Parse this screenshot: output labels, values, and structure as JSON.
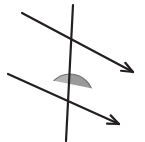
{
  "canvas": {
    "width": 145,
    "height": 142,
    "background": "#ffffff",
    "title": "Parallel lines cut by a transversal with two shaded co-interior angles"
  },
  "palette": {
    "stroke": "#231f20",
    "angle_fill_dark": "#9a9a9a",
    "angle_fill_light": "#b3b3b3",
    "angle_edge": "#6e6e6e",
    "background": "#ffffff"
  },
  "figure": {
    "stroke_width": 2.2,
    "lines": [
      {
        "id": "upper-parallel-ray",
        "label": "upper parallel line",
        "x1": 22,
        "y1": 13,
        "x2": 133,
        "y2": 72,
        "arrow_at": "end"
      },
      {
        "id": "lower-parallel-ray",
        "label": "lower parallel line",
        "x1": 8,
        "y1": 74,
        "x2": 119,
        "y2": 124,
        "arrow_at": "end"
      },
      {
        "id": "transversal-line",
        "label": "transversal",
        "x1": 73,
        "y1": 5,
        "x2": 66,
        "y2": 141,
        "arrow_at": "none"
      }
    ],
    "angles": [
      {
        "id": "upper-angle-mark",
        "label": "shaded angle at upper intersection",
        "cx": 72,
        "cy": 43,
        "radius": 23,
        "flat_edge_angle_deg": 28,
        "bulge": "below",
        "fill_left": "#b3b3b3",
        "fill_right": "#9a9a9a"
      },
      {
        "id": "lower-angle-mark",
        "label": "shaded angle at lower intersection",
        "cx": 70,
        "cy": 97,
        "radius": 23,
        "flat_edge_angle_deg": 24,
        "bulge": "above",
        "fill_left": "#b3b3b3",
        "fill_right": "#9a9a9a"
      }
    ],
    "arrowheads": [
      {
        "id": "upper-arrowhead",
        "x": 133,
        "y": 72,
        "angle_deg": 28
      },
      {
        "id": "lower-arrowhead",
        "x": 119,
        "y": 124,
        "angle_deg": 24
      }
    ]
  }
}
